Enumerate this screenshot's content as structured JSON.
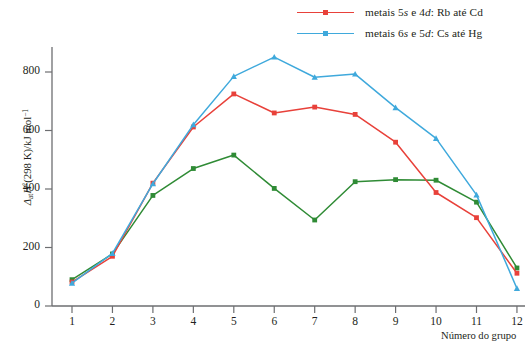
{
  "chart_data": {
    "type": "line",
    "title": "",
    "xlabel": "Número do grupo",
    "ylabel": "ΔatH°(298 K)/kJ mol⁻¹",
    "ylabel_parts": {
      "delta": "Δ",
      "sub": "at",
      "h": "H",
      "degree": "°",
      "paren": "(298 K)/kJ mol",
      "sup": "−1"
    },
    "categories": [
      1,
      2,
      3,
      4,
      5,
      6,
      7,
      8,
      9,
      10,
      11,
      12
    ],
    "x": [
      1,
      2,
      3,
      4,
      5,
      6,
      7,
      8,
      9,
      10,
      11,
      12
    ],
    "xtick_labels": [
      "1",
      "2",
      "3",
      "4",
      "5",
      "6",
      "7",
      "8",
      "9",
      "10",
      "11",
      "12"
    ],
    "ytick_labels": [
      "0",
      "200",
      "400",
      "600",
      "800"
    ],
    "yticks": [
      0,
      200,
      400,
      600,
      800
    ],
    "xlim": [
      0.5,
      12.5
    ],
    "ylim": [
      0,
      900
    ],
    "grid": false,
    "legend_position": "top-right",
    "series": [
      {
        "name": "metais 5s e 4d: Rb até Cd",
        "name_parts": {
          "prefix": "metais ",
          "n1": "5",
          "orb1": "s",
          "mid": " e ",
          "n2": "4",
          "orb2": "d",
          "suffix": ": Rb até Cd"
        },
        "color": "#e8413a",
        "marker": "square",
        "values": [
          82,
          170,
          420,
          612,
          725,
          660,
          680,
          655,
          560,
          388,
          302,
          112
        ]
      },
      {
        "name": "metais 6s e 5d: Cs até Hg",
        "name_parts": {
          "prefix": "metais ",
          "n1": "6",
          "orb1": "s",
          "mid": " e ",
          "n2": "5",
          "orb2": "d",
          "suffix": ": Cs até Hg"
        },
        "color": "#3fa9dc",
        "marker": "triangle",
        "values": [
          78,
          180,
          418,
          620,
          785,
          851,
          782,
          793,
          678,
          573,
          380,
          60
        ]
      },
      {
        "name": "",
        "name_parts": null,
        "color": "#2f8b35",
        "marker": "square",
        "values": [
          90,
          178,
          378,
          470,
          516,
          402,
          294,
          425,
          432,
          430,
          355,
          130
        ]
      }
    ]
  },
  "axes": {
    "y_label_full": "ΔatH°(298 K)/kJ mol⁻¹",
    "x_label_full": "Número do grupo"
  },
  "legend": {
    "items": [
      {
        "label": "metais 5s e 4d: Rb até Cd",
        "color": "#e8413a"
      },
      {
        "label": "metais 6s e 5d: Cs até Hg",
        "color": "#3fa9dc"
      }
    ]
  },
  "colors": {
    "series_red": "#e8413a",
    "series_blue": "#3fa9dc",
    "series_green": "#2f8b35",
    "axis": "#6d6e71",
    "text": "#231f20"
  }
}
